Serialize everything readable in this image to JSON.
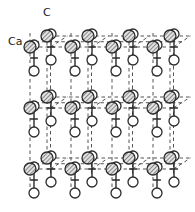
{
  "figure": {
    "name": "calcite-crystal-structure",
    "background": "#ffffff",
    "width": 195,
    "height": 212,
    "line_color": "#2b2b2b",
    "dash_color": "#555555",
    "atom_fill_oxygen": "#ffffff",
    "atom_fill_calcium": "#d9d9d9",
    "hatch_color": "#333333"
  },
  "labels": [
    {
      "id": "label-c",
      "text": "C",
      "x": 43,
      "y": 16
    },
    {
      "id": "label-ca",
      "text": "Ca",
      "x": 8,
      "y": 45
    }
  ],
  "legend": {
    "carbon_label": "C",
    "calcium_label": "Ca",
    "oxygen_symbol": "open-circle",
    "calcium_symbol": "hatched-circle"
  },
  "geometry": {
    "cell_x_step": 41,
    "cell_y_step": 61,
    "depth_dx": 17,
    "depth_dy": -11,
    "oxygen_radius": 5.0,
    "calcium_radius": 6.0,
    "bond_half_length": 13,
    "rows_y": [
      47,
      108,
      169
    ],
    "cols_x": [
      30,
      71,
      112,
      153
    ]
  },
  "structure": {
    "description_type": "ball-and-stick lattice",
    "carbonate_groups_front": [
      {
        "x": 51,
        "y": 47
      },
      {
        "x": 92,
        "y": 47
      },
      {
        "x": 133,
        "y": 47
      },
      {
        "x": 174,
        "y": 47
      },
      {
        "x": 51,
        "y": 108
      },
      {
        "x": 92,
        "y": 108
      },
      {
        "x": 133,
        "y": 108
      },
      {
        "x": 174,
        "y": 108
      },
      {
        "x": 51,
        "y": 169
      },
      {
        "x": 92,
        "y": 169
      },
      {
        "x": 133,
        "y": 169
      },
      {
        "x": 174,
        "y": 169
      }
    ],
    "carbonate_groups_back": [
      {
        "x": 34,
        "y": 58
      },
      {
        "x": 75,
        "y": 58
      },
      {
        "x": 116,
        "y": 58
      },
      {
        "x": 157,
        "y": 58
      },
      {
        "x": 34,
        "y": 119
      },
      {
        "x": 75,
        "y": 119
      },
      {
        "x": 116,
        "y": 119
      },
      {
        "x": 157,
        "y": 119
      },
      {
        "x": 34,
        "y": 180
      },
      {
        "x": 75,
        "y": 180
      },
      {
        "x": 116,
        "y": 180
      },
      {
        "x": 157,
        "y": 180
      }
    ],
    "calcium_sites_front": [
      {
        "x": 30,
        "y": 47
      },
      {
        "x": 71,
        "y": 47
      },
      {
        "x": 112,
        "y": 47
      },
      {
        "x": 153,
        "y": 47
      },
      {
        "x": 30,
        "y": 108
      },
      {
        "x": 71,
        "y": 108
      },
      {
        "x": 112,
        "y": 108
      },
      {
        "x": 153,
        "y": 108
      },
      {
        "x": 30,
        "y": 169
      },
      {
        "x": 71,
        "y": 169
      },
      {
        "x": 112,
        "y": 169
      },
      {
        "x": 153,
        "y": 169
      }
    ],
    "calcium_sites_back": [
      {
        "x": 47,
        "y": 36
      },
      {
        "x": 88,
        "y": 36
      },
      {
        "x": 129,
        "y": 36
      },
      {
        "x": 170,
        "y": 36
      },
      {
        "x": 47,
        "y": 97
      },
      {
        "x": 88,
        "y": 97
      },
      {
        "x": 129,
        "y": 97
      },
      {
        "x": 170,
        "y": 97
      },
      {
        "x": 47,
        "y": 158
      },
      {
        "x": 88,
        "y": 158
      },
      {
        "x": 129,
        "y": 158
      },
      {
        "x": 170,
        "y": 158
      }
    ]
  }
}
